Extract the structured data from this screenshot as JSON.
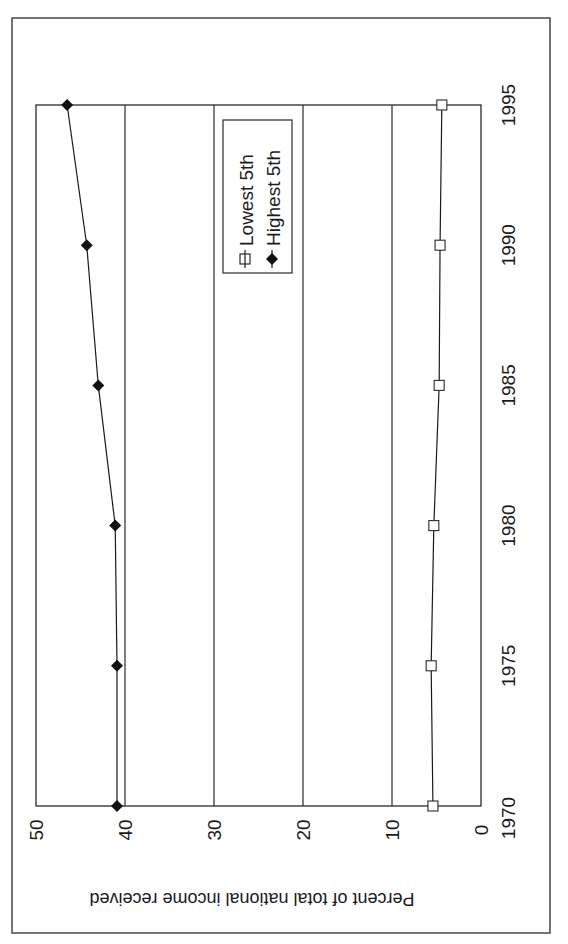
{
  "chart_data": {
    "type": "line",
    "title": "",
    "xlabel": "",
    "ylabel": "Percent of total national income received",
    "x": [
      1970,
      1975,
      1980,
      1985,
      1990,
      1995
    ],
    "x_tick_labels": [
      "1970",
      "1975",
      "1980",
      "1985",
      "1990",
      "1995"
    ],
    "y_tick_labels": [
      "0",
      "10",
      "20",
      "30",
      "40",
      "50"
    ],
    "ylim": [
      0,
      50
    ],
    "xlim": [
      1970,
      1995
    ],
    "grid": {
      "horizontal": true,
      "vertical": false,
      "values": [
        10,
        20,
        30,
        40
      ]
    },
    "legend_position": "upper-center-inside",
    "orientation": "rotated 90 degrees counterclockwise",
    "series": [
      {
        "name": "Lowest 5th",
        "marker": "open-square",
        "values": [
          5.4,
          5.6,
          5.3,
          4.7,
          4.6,
          4.4
        ]
      },
      {
        "name": "Highest 5th",
        "marker": "filled-diamond",
        "values": [
          40.9,
          40.9,
          41.1,
          43.0,
          44.3,
          46.5
        ]
      }
    ]
  },
  "legend": {
    "items": [
      {
        "label": "Lowest 5th",
        "icon": "open-square-marker"
      },
      {
        "label": "Highest 5th",
        "icon": "filled-diamond-marker"
      }
    ]
  },
  "colors": {
    "line": "#1a1a1a",
    "frame": "#3a3a3a",
    "background": "#ffffff"
  }
}
